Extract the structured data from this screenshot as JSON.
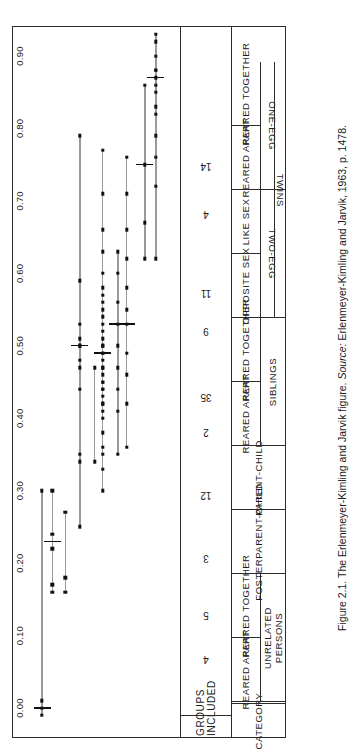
{
  "caption": {
    "prefix": "Figure 2.1. The Erlenmeyer-Kimling and Jarvik figure. ",
    "source_label": "Source:",
    "source_text": " Erlenmeyer-Kimling and Jarvik, 1963, p. 1478."
  },
  "headers": {
    "category": "CATEGORY",
    "groups_included": "GROUPS\nINCLUDED"
  },
  "group_labels": {
    "unrelated_persons": "UNRELATED\nPERSONS",
    "fosterparent_child": "FOSTERPARENT-CHILD",
    "parent_child": "PARENT-CHILD",
    "siblings": "SIBLINGS",
    "twins": "TWINS",
    "two_egg": "TWO-EGG",
    "one_egg": "ONE-EGG"
  },
  "rows": [
    {
      "label": "REARED APART",
      "groups": "4"
    },
    {
      "label": "REARED TOGETHER",
      "groups": "5"
    },
    {
      "label": "",
      "groups": "3"
    },
    {
      "label": "",
      "groups": "12"
    },
    {
      "label": "REARED APART",
      "groups": "2"
    },
    {
      "label": "REARED TOGETHER",
      "groups": "35"
    },
    {
      "label": "OPPOSITE SEX",
      "groups": "9"
    },
    {
      "label": "LIKE SEX",
      "groups": "11"
    },
    {
      "label": "REARED APART",
      "groups": "4"
    },
    {
      "label": "REARED TOGETHER",
      "groups": "14"
    }
  ],
  "chart_data": {
    "type": "scatter",
    "title": "The Erlenmeyer-Kimling and Jarvik figure",
    "xlabel": "",
    "ylabel": "",
    "orientation": "vertical-strips",
    "xlim": [
      0.0,
      0.95
    ],
    "ticks": [
      "0.00",
      "0.10",
      "0.20",
      "0.30",
      "0.40",
      "0.50",
      "0.60",
      "0.70",
      "0.80",
      "0.90"
    ],
    "tick_values": [
      0.0,
      0.1,
      0.2,
      0.3,
      0.4,
      0.5,
      0.6,
      0.7,
      0.8,
      0.9
    ],
    "grid": false,
    "legend": "none",
    "series": [
      {
        "name": "Unrelated persons, reared apart",
        "groups": 4,
        "range": [
          -0.01,
          0.3
        ],
        "median": 0.0,
        "values": [
          -0.01,
          0.0,
          0.01,
          0.3
        ]
      },
      {
        "name": "Unrelated persons, reared together",
        "groups": 5,
        "range": [
          0.16,
          0.3
        ],
        "median": 0.23,
        "values": [
          0.16,
          0.17,
          0.22,
          0.24,
          0.3
        ]
      },
      {
        "name": "Fosterparent-child",
        "groups": 3,
        "range": [
          0.16,
          0.27
        ],
        "median": null,
        "values": [
          0.16,
          0.18,
          0.27
        ]
      },
      {
        "name": "Parent-child",
        "groups": 12,
        "range": [
          0.25,
          0.79
        ],
        "median": 0.5,
        "values": [
          0.25,
          0.34,
          0.35,
          0.44,
          0.47,
          0.48,
          0.5,
          0.5,
          0.51,
          0.53,
          0.59,
          0.79
        ]
      },
      {
        "name": "Siblings, reared apart",
        "groups": 2,
        "range": [
          0.34,
          0.47
        ],
        "median": null,
        "values": [
          0.34,
          0.47
        ]
      },
      {
        "name": "Siblings, reared together",
        "groups": 35,
        "median": 0.49,
        "range": [
          0.3,
          0.77
        ],
        "values": [
          0.3,
          0.33,
          0.35,
          0.36,
          0.38,
          0.4,
          0.41,
          0.42,
          0.42,
          0.43,
          0.44,
          0.44,
          0.45,
          0.45,
          0.46,
          0.47,
          0.47,
          0.48,
          0.49,
          0.49,
          0.5,
          0.5,
          0.51,
          0.52,
          0.53,
          0.54,
          0.55,
          0.56,
          0.57,
          0.58,
          0.6,
          0.63,
          0.66,
          0.71,
          0.77
        ]
      },
      {
        "name": "Two-egg twins, opposite sex",
        "groups": 9,
        "range": [
          0.35,
          0.63
        ],
        "median": 0.53,
        "values": [
          0.35,
          0.41,
          0.44,
          0.47,
          0.5,
          0.53,
          0.56,
          0.6,
          0.63
        ]
      },
      {
        "name": "Two-egg twins, like sex",
        "groups": 11,
        "range": [
          0.36,
          0.76
        ],
        "median": 0.53,
        "values": [
          0.36,
          0.42,
          0.46,
          0.49,
          0.53,
          0.55,
          0.58,
          0.62,
          0.66,
          0.71,
          0.76
        ]
      },
      {
        "name": "One-egg twins, reared apart",
        "groups": 4,
        "range": [
          0.62,
          0.86
        ],
        "median": 0.75,
        "values": [
          0.62,
          0.67,
          0.75,
          0.86
        ]
      },
      {
        "name": "One-egg twins, reared together",
        "groups": 14,
        "range": [
          0.62,
          0.93
        ],
        "median": 0.87,
        "values": [
          0.62,
          0.72,
          0.76,
          0.79,
          0.82,
          0.83,
          0.85,
          0.86,
          0.87,
          0.88,
          0.88,
          0.9,
          0.92,
          0.93
        ]
      }
    ]
  }
}
